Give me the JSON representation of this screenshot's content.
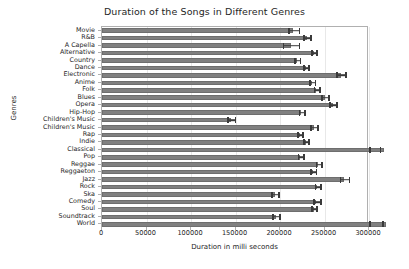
{
  "chart_data": {
    "type": "bar",
    "orientation": "horizontal",
    "title": "Duration of the Songs in Different Genres",
    "xlabel": "Duration in milli seconds",
    "ylabel": "Genres",
    "categories": [
      "Movie",
      "R&B",
      "A Capella",
      "Alternative",
      "Country",
      "Dance",
      "Electronic",
      "Anime",
      "Folk",
      "Blues",
      "Opera",
      "Hip-Hop",
      "Children's Music",
      "Children's Music",
      "Rap",
      "Indie",
      "Classical",
      "Pop",
      "Reggae",
      "Reggaeton",
      "Jazz",
      "Rock",
      "Ska",
      "Comedy",
      "Soul",
      "Soundtrack",
      "World"
    ],
    "values": [
      215000,
      230000,
      212000,
      238000,
      219000,
      229000,
      268000,
      236000,
      241000,
      250000,
      259000,
      224000,
      145000,
      238000,
      222000,
      229000,
      317000,
      223000,
      243000,
      237000,
      272000,
      242000,
      194000,
      241000,
      238000,
      195000,
      319000
    ],
    "errors": [
      6000,
      4000,
      9000,
      3000,
      3000,
      3000,
      5000,
      3000,
      3000,
      4000,
      4000,
      3000,
      4000,
      4000,
      3000,
      3000,
      5000,
      3000,
      3000,
      3000,
      5000,
      3000,
      4000,
      4000,
      3000,
      4000,
      4000
    ],
    "xticks": [
      0,
      50000,
      100000,
      150000,
      200000,
      250000,
      300000
    ],
    "xtick_labels": [
      "0",
      "50000",
      "100000",
      "150000",
      "200000",
      "250000",
      "300000"
    ],
    "xlim": [
      0,
      300000
    ],
    "grid": true,
    "bar_color": "#808080",
    "error_color": "#3a3a3a",
    "background": "#ffffff"
  }
}
